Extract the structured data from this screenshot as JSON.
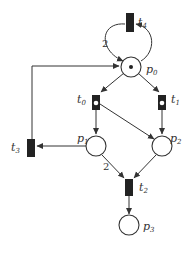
{
  "diagram": {
    "type": "petri-net",
    "places": [
      {
        "id": "p0",
        "label": "p",
        "sub": "0",
        "tokens": 1
      },
      {
        "id": "p1",
        "label": "p",
        "sub": "1",
        "tokens": 0
      },
      {
        "id": "p2",
        "label": "p",
        "sub": "2",
        "tokens": 0
      },
      {
        "id": "p3",
        "label": "p",
        "sub": "3",
        "tokens": 0
      }
    ],
    "transitions": [
      {
        "id": "t0",
        "label": "t",
        "sub": "0",
        "enabled": true
      },
      {
        "id": "t1",
        "label": "t",
        "sub": "1",
        "enabled": true
      },
      {
        "id": "t2",
        "label": "t",
        "sub": "2",
        "enabled": false
      },
      {
        "id": "t3",
        "label": "t",
        "sub": "3",
        "enabled": false
      },
      {
        "id": "t4",
        "label": "t",
        "sub": "4",
        "enabled": false
      }
    ],
    "arc_weights": {
      "t4_p0": "2",
      "p1_t2": "2"
    },
    "colors": {
      "stroke": "#333333",
      "transition": "#222222",
      "background": "#ffffff"
    }
  }
}
